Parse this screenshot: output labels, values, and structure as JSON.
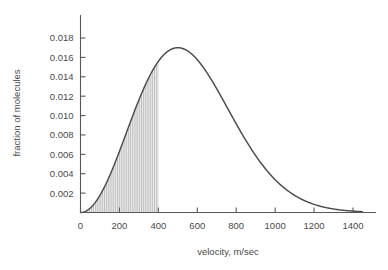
{
  "chart_data": {
    "type": "line",
    "title": "",
    "subtitle": "",
    "xlabel": "velocity, m/sec",
    "ylabel": "fraction of molecules",
    "xlim": [
      0,
      1450
    ],
    "ylim": [
      0,
      0.0191
    ],
    "grid": false,
    "legend": null,
    "x_ticks": [
      0,
      200,
      400,
      600,
      800,
      1000,
      1200,
      1400
    ],
    "x_tick_labels": [
      "0",
      "200",
      "400",
      "600",
      "800",
      "1000",
      "1200",
      "1400"
    ],
    "y_ticks": [
      0.002,
      0.004,
      0.006,
      0.008,
      0.01,
      0.012,
      0.014,
      0.016,
      0.018
    ],
    "y_tick_labels": [
      "0.002",
      "0.004",
      "0.006",
      "0.008",
      "0.010",
      "0.012",
      "0.014",
      "0.016",
      "0.018"
    ],
    "series": [
      {
        "name": "Maxwell-Boltzmann speed distribution",
        "x": [
          0,
          25,
          50,
          75,
          100,
          125,
          150,
          175,
          200,
          225,
          250,
          275,
          300,
          325,
          350,
          375,
          400,
          425,
          450,
          475,
          500,
          525,
          550,
          575,
          600,
          625,
          650,
          675,
          700,
          725,
          750,
          775,
          800,
          850,
          900,
          950,
          1000,
          1050,
          1100,
          1150,
          1200,
          1250,
          1300,
          1350,
          1400,
          1450
        ],
        "y": [
          0.0,
          9e-05,
          0.00035,
          0.00078,
          0.00136,
          0.00207,
          0.00289,
          0.00379,
          0.00473,
          0.00569,
          0.00665,
          0.00641,
          0.00857,
          0.01046,
          0.01227,
          0.01374,
          0.01483,
          0.01574,
          0.01645,
          0.01691,
          0.01706,
          0.017,
          0.01672,
          0.01621,
          0.01552,
          0.01469,
          0.01375,
          0.01273,
          0.01167,
          0.0106,
          0.00954,
          0.00851,
          0.00753,
          0.00576,
          0.00429,
          0.00312,
          0.00221,
          0.00153,
          0.00103,
          0.00068,
          0.00044,
          0.00028,
          0.00017,
          0.0001,
          6e-05,
          3e-05
        ],
        "peak_x": 500,
        "peak_y": 0.017,
        "color": "#4b4b4b"
      }
    ],
    "shaded_region": {
      "label": "shaded area under curve",
      "x_start": 0,
      "x_end": 400,
      "pattern": "vertical-hatch",
      "hatch_color": "#9a9a9a",
      "fill_color": "#f4f4f4",
      "value_at_end": 0.01483
    },
    "colors": {
      "curve": "#4b4b4b",
      "axis": "#55585c",
      "text": "#4a4a4a",
      "hatch": "#9a9a9a",
      "background": "#ffffff"
    }
  }
}
